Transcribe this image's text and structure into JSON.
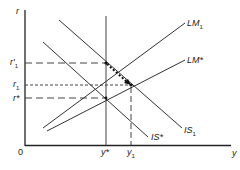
{
  "diagram": {
    "type": "IS-LM diagram",
    "axes": {
      "vertical_label": "r",
      "horizontal_label": "y",
      "origin_label": "0"
    },
    "curves": [
      {
        "id": "LM1",
        "label": "LM",
        "sub": "1"
      },
      {
        "id": "LMstar",
        "label": "LM*",
        "sub": ""
      },
      {
        "id": "IS1",
        "label": "IS",
        "sub": "1"
      },
      {
        "id": "ISstar",
        "label": "IS*",
        "sub": ""
      }
    ],
    "r_levels": [
      {
        "id": "r_prime_1",
        "label": "r'",
        "sub": "1"
      },
      {
        "id": "r_1",
        "label": "r",
        "sub": "1"
      },
      {
        "id": "r_star",
        "label": "r*",
        "sub": ""
      }
    ],
    "y_levels": [
      {
        "id": "y_star",
        "label": "y*",
        "sub": ""
      },
      {
        "id": "y_1",
        "label": "y",
        "sub": "1"
      }
    ],
    "annotations": [
      "dotted arrow along IS1 from (y*, r'1) to (y1, r1)"
    ],
    "colors": {
      "line": "#222222",
      "background": "#ffffff"
    }
  }
}
